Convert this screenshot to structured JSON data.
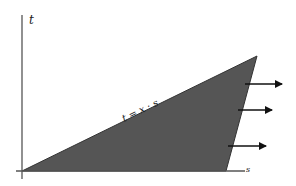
{
  "diagram": {
    "axes": {
      "y_label": "t",
      "x_label": "s",
      "color": "#555555"
    },
    "region": {
      "fill": "#555555",
      "stroke": "#333333",
      "vertices": [
        [
          22,
          171
        ],
        [
          257,
          56
        ],
        [
          226,
          171
        ]
      ]
    },
    "line_label": "t = x · s",
    "arrows": [
      {
        "x1": 245,
        "y1": 84,
        "x2": 282,
        "y2": 84
      },
      {
        "x1": 238,
        "y1": 110,
        "x2": 272,
        "y2": 110
      },
      {
        "x1": 228,
        "y1": 146,
        "x2": 266,
        "y2": 146
      }
    ],
    "arrow_color": "#111111"
  }
}
